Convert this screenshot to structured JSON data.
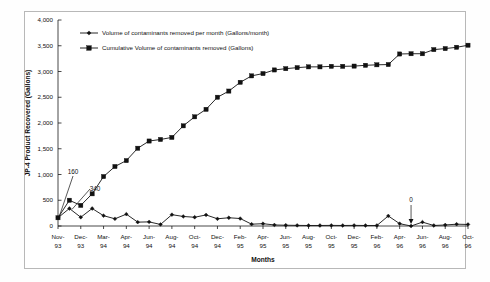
{
  "chart_data": {
    "type": "line",
    "title": "",
    "xlabel": "Months",
    "ylabel": "JP-4 Product Recovered (Gallons)",
    "ylim": [
      0,
      4000
    ],
    "ytick_labels": [
      "0",
      "500",
      "1,000",
      "1,500",
      "2,000",
      "2,500",
      "3,000",
      "3,500",
      "4,000"
    ],
    "ytick_values": [
      0,
      500,
      1000,
      1500,
      2000,
      2500,
      3000,
      3500,
      4000
    ],
    "grid": false,
    "legend_position": "top-left-inside",
    "x": [
      "Nov-93",
      "Dec-93",
      "Jan-94",
      "Feb-94",
      "Mar-94",
      "Apr-94",
      "May-94",
      "Jun-94",
      "Jul-94",
      "Aug-94",
      "Sep-94",
      "Oct-94",
      "Nov-94",
      "Dec-94",
      "Jan-95",
      "Feb-95",
      "Mar-95",
      "Apr-95",
      "May-95",
      "Jun-95",
      "Jul-95",
      "Aug-95",
      "Sep-95",
      "Oct-95",
      "Nov-95",
      "Dec-95",
      "Jan-96",
      "Feb-96",
      "Mar-96",
      "Apr-96",
      "May-96",
      "Jun-96",
      "Jul-96",
      "Aug-96",
      "Sep-96",
      "Oct-96",
      "Nov-96"
    ],
    "xtick_labels": [
      {
        "month": "Nov-",
        "year": "93"
      },
      {
        "month": "Dec-",
        "year": "93"
      },
      {
        "month": "Mar-",
        "year": "94"
      },
      {
        "month": "Apr-",
        "year": "94"
      },
      {
        "month": "Jun-",
        "year": "94"
      },
      {
        "month": "Aug-",
        "year": "94"
      },
      {
        "month": "Oct-",
        "year": "94"
      },
      {
        "month": "Dec-",
        "year": "94"
      },
      {
        "month": "Feb-",
        "year": "95"
      },
      {
        "month": "Apr-",
        "year": "95"
      },
      {
        "month": "Jun-",
        "year": "95"
      },
      {
        "month": "Aug-",
        "year": "95"
      },
      {
        "month": "Oct-",
        "year": "95"
      },
      {
        "month": "Dec-",
        "year": "95"
      },
      {
        "month": "Feb-",
        "year": "96"
      },
      {
        "month": "Apr-",
        "year": "96"
      },
      {
        "month": "Jun-",
        "year": "96"
      },
      {
        "month": "Aug-",
        "year": "96"
      },
      {
        "month": "Oct-",
        "year": "96"
      }
    ],
    "series": [
      {
        "name": "Volume of contaminants removed per month (Gallons/month)",
        "marker": "diamond",
        "color": "#111111",
        "values": [
          160,
          340,
          170,
          340,
          200,
          140,
          230,
          75,
          80,
          30,
          220,
          185,
          170,
          215,
          140,
          160,
          145,
          35,
          45,
          20,
          15,
          12,
          10,
          10,
          12,
          10,
          12,
          10,
          10,
          195,
          45,
          0,
          75,
          10,
          20,
          35,
          30
        ]
      },
      {
        "name": "Cumulative Volume of contaminants removed (Gallons)",
        "marker": "square",
        "color": "#111111",
        "values": [
          160,
          500,
          400,
          625,
          960,
          1155,
          1270,
          1510,
          1650,
          1680,
          1720,
          1945,
          2120,
          2265,
          2500,
          2620,
          2790,
          2915,
          2960,
          3030,
          3055,
          3075,
          3090,
          3090,
          3100,
          3100,
          3105,
          3120,
          3130,
          3135,
          3340,
          3345,
          3345,
          3425,
          3445,
          3470,
          3510
        ]
      }
    ],
    "annotations": [
      {
        "label": "160",
        "target_x": "Nov-93",
        "target_y": 160
      },
      {
        "label": "340",
        "target_x": "Dec-93",
        "target_y": 340
      },
      {
        "label": "0",
        "target_x": "Jun-96",
        "target_y": 0
      }
    ]
  },
  "legend": {
    "items": [
      {
        "label": "Volume of contaminants removed per month (Gallons/month)",
        "marker": "diamond"
      },
      {
        "label": "Cumulative Volume of contaminants removed (Gallons)",
        "marker": "square"
      }
    ]
  }
}
